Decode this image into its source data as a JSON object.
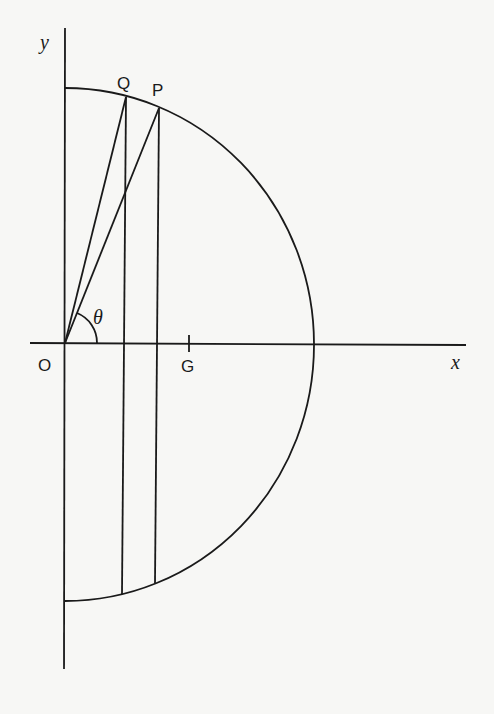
{
  "figure": {
    "axes": {
      "x_label": "x",
      "y_label": "y",
      "origin_label": "O"
    },
    "points": {
      "P": "P",
      "Q": "Q",
      "G": "G"
    },
    "angle_label": "θ",
    "colors": {
      "ink": "#1a1a1a",
      "paper": "#f7f7f5"
    }
  }
}
